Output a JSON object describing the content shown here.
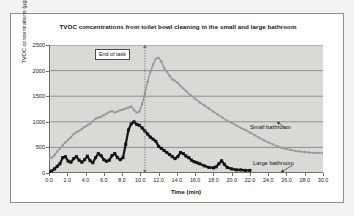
{
  "chart_data": {
    "type": "line",
    "title": "TVOC concentrations from toilet bowl cleaning in the small and large bathroom",
    "xlabel": "Time (min)",
    "ylabel": "TVOC concentrations (µg/m³)",
    "xlim": [
      0,
      30
    ],
    "ylim": [
      0,
      2500
    ],
    "grid": true,
    "legend_position": "inline-annotations",
    "xticks": [
      "0.0",
      "2.0",
      "4.0",
      "6.0",
      "8.0",
      "10.0",
      "12.0",
      "14.0",
      "16.0",
      "18.0",
      "20.0",
      "22.0",
      "24.0",
      "26.0",
      "28.0",
      "30.0"
    ],
    "xtick_values": [
      0,
      2,
      4,
      6,
      8,
      10,
      12,
      14,
      16,
      18,
      20,
      22,
      24,
      26,
      28,
      30
    ],
    "yticks": [
      "0",
      "500",
      "1000",
      "1500",
      "2000",
      "2500"
    ],
    "ytick_values": [
      0,
      500,
      1000,
      1500,
      2000,
      2500
    ],
    "annotations": [
      {
        "text": "End of task",
        "x": 10.5,
        "type": "vertical-dotted-line-with-box"
      }
    ],
    "series": [
      {
        "name": "Small bathroom",
        "color": "#9a9a9a",
        "marker": "square",
        "label_x": 24.0,
        "label_y": 960,
        "x": [
          0.0,
          0.3,
          0.6,
          0.9,
          1.2,
          1.5,
          1.8,
          2.1,
          2.4,
          2.7,
          3.0,
          3.3,
          3.6,
          3.9,
          4.2,
          4.5,
          4.8,
          5.1,
          5.4,
          5.7,
          6.0,
          6.3,
          6.6,
          6.9,
          7.2,
          7.5,
          7.8,
          8.1,
          8.4,
          8.7,
          9.0,
          9.3,
          9.6,
          9.9,
          10.2,
          10.5,
          10.8,
          11.1,
          11.4,
          11.7,
          12.0,
          12.3,
          12.6,
          12.9,
          13.2,
          13.5,
          13.8,
          14.1,
          14.4,
          14.7,
          15.0,
          15.5,
          16.0,
          16.5,
          17.0,
          17.5,
          18.0,
          18.5,
          19.0,
          19.5,
          20.0,
          20.5,
          21.0,
          21.5,
          22.0,
          22.5,
          23.0,
          23.5,
          24.0,
          24.5,
          25.0,
          25.5,
          26.0,
          26.5,
          27.0,
          27.5,
          28.0,
          28.5,
          29.0,
          29.5,
          30.0
        ],
        "y": [
          280,
          300,
          350,
          420,
          480,
          540,
          600,
          650,
          700,
          760,
          800,
          820,
          860,
          900,
          930,
          960,
          1010,
          1060,
          1080,
          1100,
          1130,
          1160,
          1190,
          1210,
          1180,
          1200,
          1230,
          1240,
          1260,
          1280,
          1300,
          1230,
          1180,
          1200,
          1350,
          1550,
          1780,
          1980,
          2120,
          2230,
          2250,
          2180,
          2050,
          1980,
          1900,
          1830,
          1800,
          1760,
          1700,
          1650,
          1600,
          1520,
          1450,
          1380,
          1320,
          1260,
          1200,
          1140,
          1080,
          1020,
          980,
          930,
          880,
          840,
          790,
          740,
          690,
          640,
          600,
          560,
          520,
          490,
          470,
          450,
          430,
          420,
          410,
          400,
          395,
          390,
          390
        ]
      },
      {
        "name": "Large bathroom",
        "color": "#141414",
        "marker": "square",
        "label_x": 24.5,
        "label_y": 310,
        "x": [
          0.0,
          0.3,
          0.6,
          0.9,
          1.2,
          1.5,
          1.8,
          2.1,
          2.4,
          2.7,
          3.0,
          3.3,
          3.6,
          3.9,
          4.2,
          4.5,
          4.8,
          5.1,
          5.4,
          5.7,
          6.0,
          6.3,
          6.6,
          6.9,
          7.2,
          7.5,
          7.8,
          8.1,
          8.4,
          8.7,
          9.0,
          9.3,
          9.6,
          9.9,
          10.2,
          10.5,
          10.8,
          11.1,
          11.4,
          11.7,
          12.0,
          12.3,
          12.6,
          12.9,
          13.2,
          13.5,
          13.8,
          14.1,
          14.4,
          14.7,
          15.0,
          15.3,
          15.6,
          15.9,
          16.2,
          16.5,
          17.0,
          17.5,
          18.0,
          18.3,
          18.6,
          18.9,
          19.2,
          19.5,
          20.0,
          20.5,
          21.0,
          21.5,
          22.0
        ],
        "y": [
          20,
          40,
          80,
          130,
          180,
          300,
          320,
          230,
          210,
          280,
          320,
          250,
          210,
          260,
          330,
          240,
          200,
          300,
          380,
          340,
          260,
          230,
          250,
          340,
          380,
          300,
          260,
          300,
          560,
          840,
          960,
          1000,
          950,
          930,
          880,
          820,
          760,
          700,
          660,
          620,
          520,
          480,
          440,
          400,
          360,
          320,
          280,
          320,
          400,
          380,
          330,
          300,
          250,
          220,
          200,
          180,
          140,
          110,
          100,
          120,
          180,
          240,
          170,
          110,
          80,
          60,
          60,
          50,
          50
        ]
      }
    ]
  }
}
